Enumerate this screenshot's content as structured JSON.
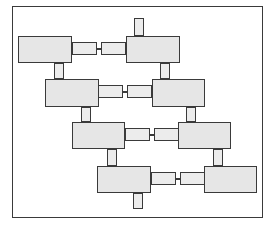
{
  "diagram": {
    "title": "",
    "colors": {
      "block_fill": "#e6e6e6",
      "connector_fill": "#ececec",
      "stroke": "#3a3a3a",
      "background": "#ffffff"
    },
    "frame": {
      "x": 12,
      "y": 6,
      "w": 251,
      "h": 212
    },
    "blocks": [
      {
        "id": "r1-left",
        "x": 18,
        "y": 36,
        "w": 54,
        "h": 27
      },
      {
        "id": "r1-right",
        "x": 126,
        "y": 36,
        "w": 54,
        "h": 27
      },
      {
        "id": "r2-left",
        "x": 45,
        "y": 79,
        "w": 54,
        "h": 28
      },
      {
        "id": "r2-right",
        "x": 152,
        "y": 79,
        "w": 53,
        "h": 28
      },
      {
        "id": "r3-left",
        "x": 72,
        "y": 122,
        "w": 53,
        "h": 27
      },
      {
        "id": "r3-right",
        "x": 178,
        "y": 122,
        "w": 53,
        "h": 27
      },
      {
        "id": "r4-left",
        "x": 97,
        "y": 166,
        "w": 54,
        "h": 27
      },
      {
        "id": "r4-right",
        "x": 204,
        "y": 166,
        "w": 53,
        "h": 27
      }
    ],
    "horizontal_connectors": [
      {
        "id": "r1-a",
        "x": 72,
        "y": 42,
        "w": 25,
        "h": 13
      },
      {
        "id": "r1-b",
        "x": 101,
        "y": 42,
        "w": 25,
        "h": 13
      },
      {
        "id": "r2-a",
        "x": 98,
        "y": 85,
        "w": 25,
        "h": 13
      },
      {
        "id": "r2-b",
        "x": 127,
        "y": 85,
        "w": 25,
        "h": 13
      },
      {
        "id": "r3-a",
        "x": 125,
        "y": 128,
        "w": 25,
        "h": 13
      },
      {
        "id": "r3-b",
        "x": 154,
        "y": 128,
        "w": 25,
        "h": 13
      },
      {
        "id": "r4-a",
        "x": 151,
        "y": 172,
        "w": 25,
        "h": 13
      },
      {
        "id": "r4-b",
        "x": 180,
        "y": 172,
        "w": 25,
        "h": 13
      }
    ],
    "bridges": [
      {
        "id": "r1-bridge",
        "x": 97,
        "y": 48,
        "w": 4,
        "h": 1.5
      },
      {
        "id": "r2-bridge",
        "x": 123,
        "y": 91,
        "w": 4,
        "h": 1.5
      },
      {
        "id": "r3-bridge",
        "x": 150,
        "y": 134,
        "w": 4,
        "h": 1.5
      },
      {
        "id": "r4-bridge",
        "x": 176,
        "y": 178,
        "w": 4,
        "h": 1.5
      }
    ],
    "vertical_stubs": [
      {
        "id": "top-stub",
        "x": 134,
        "y": 18,
        "w": 10,
        "h": 18
      },
      {
        "id": "r1r2-left",
        "x": 54,
        "y": 63,
        "w": 10,
        "h": 16
      },
      {
        "id": "r1r2-right",
        "x": 160,
        "y": 63,
        "w": 10,
        "h": 16
      },
      {
        "id": "r2r3-left",
        "x": 81,
        "y": 107,
        "w": 10,
        "h": 15
      },
      {
        "id": "r2r3-right",
        "x": 186,
        "y": 107,
        "w": 10,
        "h": 15
      },
      {
        "id": "r3r4-left",
        "x": 107,
        "y": 149,
        "w": 10,
        "h": 17
      },
      {
        "id": "r3r4-right",
        "x": 213,
        "y": 149,
        "w": 10,
        "h": 17
      },
      {
        "id": "bottom-stub",
        "x": 133,
        "y": 193,
        "w": 10,
        "h": 16
      }
    ]
  }
}
